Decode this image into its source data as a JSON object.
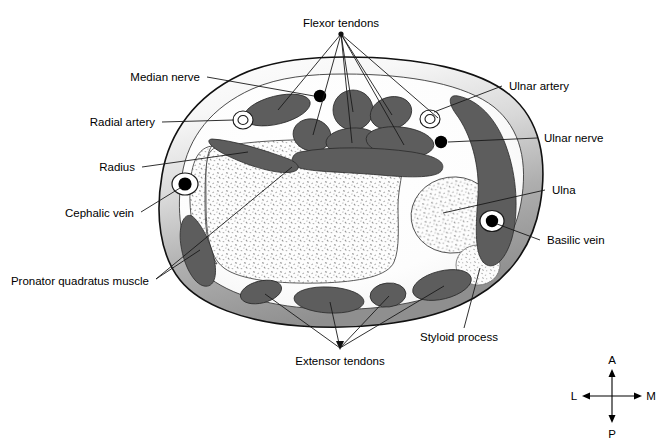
{
  "figure": {
    "kind": "anatomical-cross-section",
    "region": "distal forearm / wrist transverse section",
    "background_color": "#ffffff",
    "outline_color": "#1a1a1a",
    "tendon_color": "#5d5d5d",
    "bone_fill_color": "#fbfbfb",
    "soft_tissue_color": "#f2f2f2"
  },
  "labels": {
    "flexor_tendons": "Flexor tendons",
    "median_nerve": "Median nerve",
    "radial_artery": "Radial artery",
    "radius": "Radius",
    "cephalic_vein": "Cephalic vein",
    "pronator_quadratus_muscle": "Pronator quadratus muscle",
    "extensor_tendons": "Extensor tendons",
    "styloid_process": "Styloid process",
    "ulnar_artery": "Ulnar artery",
    "ulnar_nerve": "Ulnar nerve",
    "ulna": "Ulna",
    "basilic_vein": "Basilic vein"
  },
  "compass": {
    "anterior": "A",
    "posterior": "P",
    "lateral": "L",
    "medial": "M"
  },
  "structures": [
    {
      "name": "radius",
      "type": "bone",
      "label": "Radius"
    },
    {
      "name": "ulna",
      "type": "bone",
      "label": "Ulna"
    },
    {
      "name": "styloid-process",
      "type": "bone",
      "label": "Styloid process"
    },
    {
      "name": "radial-artery",
      "type": "artery",
      "label": "Radial artery"
    },
    {
      "name": "ulnar-artery",
      "type": "artery",
      "label": "Ulnar artery"
    },
    {
      "name": "median-nerve",
      "type": "nerve",
      "label": "Median nerve"
    },
    {
      "name": "ulnar-nerve",
      "type": "nerve",
      "label": "Ulnar nerve"
    },
    {
      "name": "cephalic-vein",
      "type": "vein",
      "label": "Cephalic vein"
    },
    {
      "name": "basilic-vein",
      "type": "vein",
      "label": "Basilic vein"
    },
    {
      "name": "flexor-tendons",
      "type": "tendon-group",
      "label": "Flexor tendons"
    },
    {
      "name": "extensor-tendons",
      "type": "tendon-group",
      "label": "Extensor tendons"
    },
    {
      "name": "pronator-quadratus-muscle",
      "type": "muscle",
      "label": "Pronator quadratus muscle"
    }
  ]
}
